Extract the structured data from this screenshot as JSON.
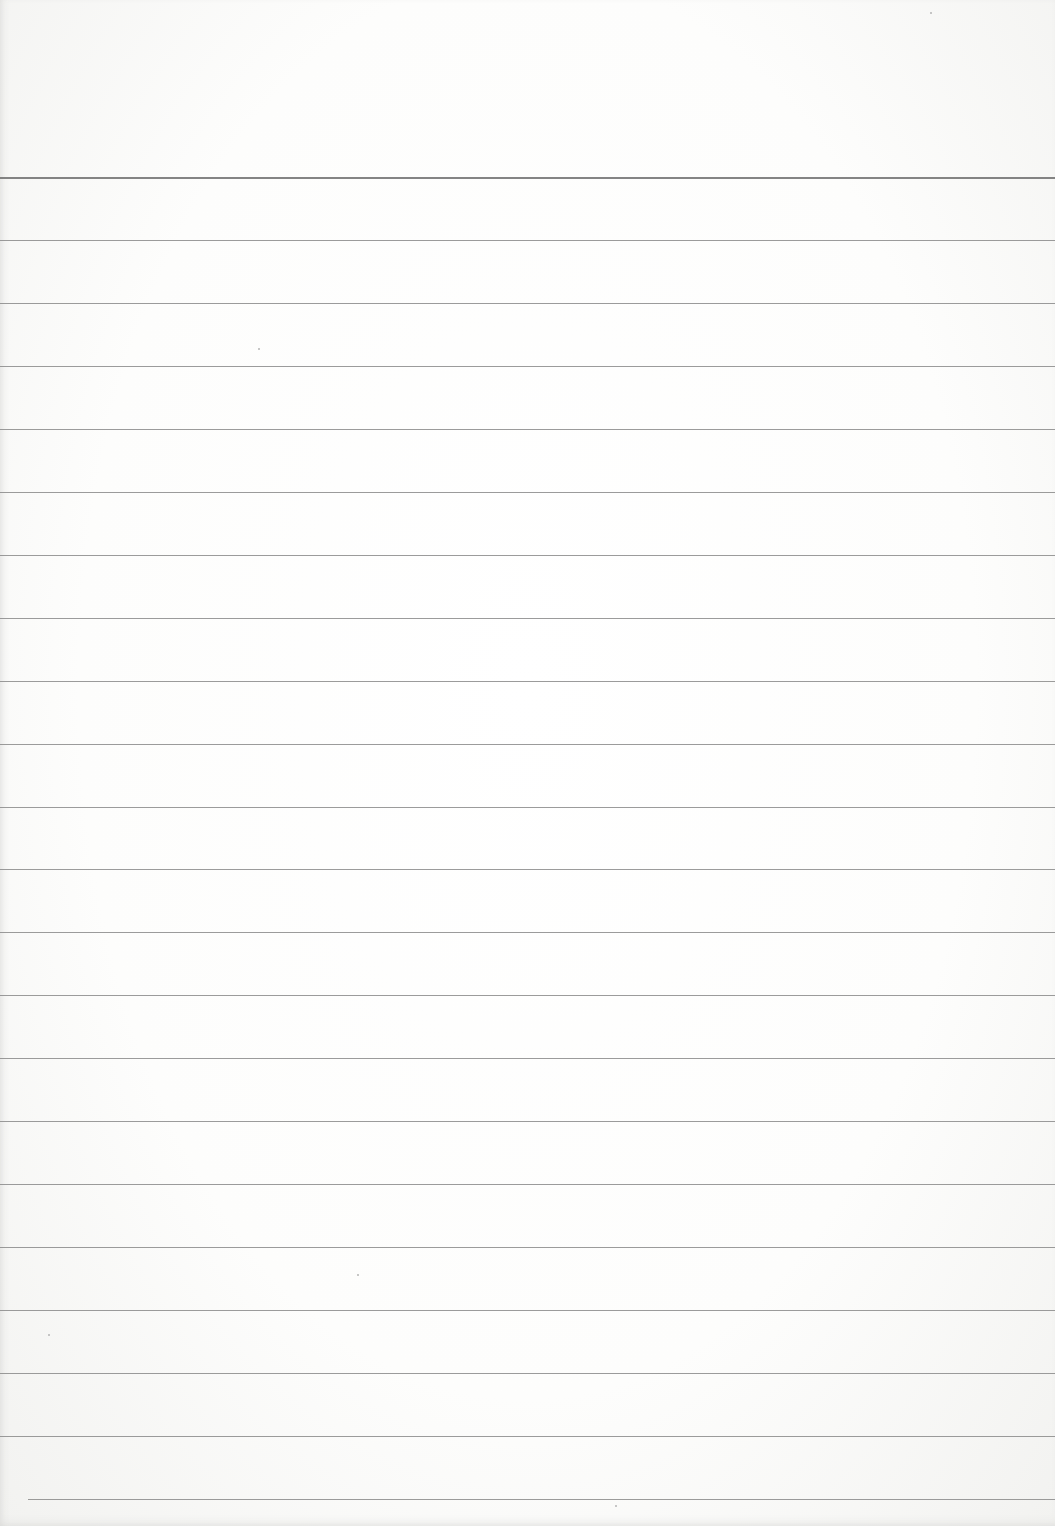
{
  "page": {
    "type": "blank lined paper",
    "background_color": "#ffffff",
    "rule_color": "#8a8a8a",
    "rule_count": 22,
    "first_rule_y": 177,
    "rule_spacing": 62.95,
    "last_rule_left_offset": 28
  }
}
